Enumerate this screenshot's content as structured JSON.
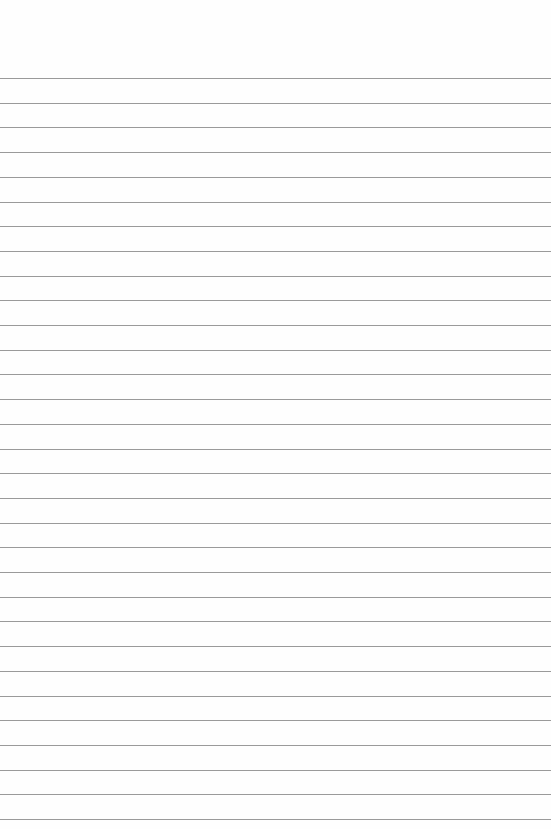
{
  "page": {
    "type": "lined-paper",
    "background_color": "#fefefe",
    "line_color": "#9a9a9a",
    "first_line_y": 78,
    "line_spacing": 24.7,
    "line_count": 31
  }
}
